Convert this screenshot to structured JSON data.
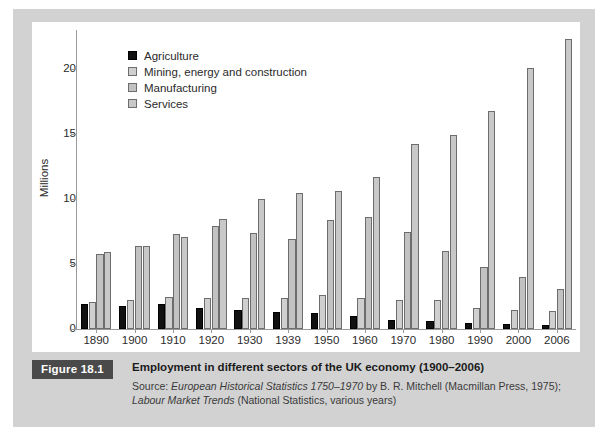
{
  "figure": {
    "badge": "Figure 18.1",
    "title": "Employment in different sectors of the UK economy (1900–2006)",
    "source_line1_prefix": "Source: ",
    "source_line1_italic": "European Historical Statistics 1750–1970",
    "source_line1_suffix": " by B. R. Mitchell (Macmillan Press, 1975);",
    "source_line2_italic": "Labour Market Trends",
    "source_line2_suffix": " (National Statistics, various years)"
  },
  "colors": {
    "agriculture": "#111111",
    "mining": "#cfcfcf",
    "manufacturing": "#c2c2c2",
    "services": "#c8c8c8",
    "frame": "#d2d2d2",
    "panel": "#ffffff",
    "axis": "#9a9a9a",
    "badge_bg": "#4a4a4a"
  },
  "chart_data": {
    "type": "bar",
    "title": "Employment in different sectors of the UK economy (1900–2006)",
    "xlabel": "",
    "ylabel": "Millions",
    "ylim": [
      0,
      23
    ],
    "yticks": [
      0,
      5,
      10,
      15,
      20
    ],
    "ytick_labels": [
      "0",
      "5",
      "10",
      "15",
      "20"
    ],
    "grid": false,
    "legend_position": "top-left-inside",
    "categories": [
      "1890",
      "1900",
      "1910",
      "1920",
      "1930",
      "1939",
      "1950",
      "1960",
      "1970",
      "1980",
      "1990",
      "2000",
      "2006"
    ],
    "series": [
      {
        "name": "Agriculture",
        "color": "#111111",
        "values": [
          1.9,
          1.8,
          1.9,
          1.6,
          1.5,
          1.3,
          1.2,
          1.0,
          0.7,
          0.6,
          0.5,
          0.4,
          0.3
        ]
      },
      {
        "name": "Mining, energy and construction",
        "color": "#cfcfcf",
        "values": [
          2.1,
          2.2,
          2.5,
          2.4,
          2.4,
          2.4,
          2.6,
          2.4,
          2.2,
          2.2,
          1.6,
          1.5,
          1.4
        ]
      },
      {
        "name": "Manufacturing",
        "color": "#c2c2c2",
        "values": [
          5.8,
          6.4,
          7.3,
          7.9,
          7.4,
          6.9,
          8.4,
          8.6,
          7.5,
          6.0,
          4.8,
          4.0,
          3.1
        ]
      },
      {
        "name": "Services",
        "color": "#c8c8c8",
        "values": [
          5.9,
          6.4,
          7.1,
          8.5,
          10.0,
          10.5,
          10.6,
          11.7,
          14.2,
          14.9,
          16.8,
          20.1,
          22.3
        ]
      }
    ]
  },
  "legend": {
    "items": [
      {
        "label": "Agriculture"
      },
      {
        "label": "Mining, energy and construction"
      },
      {
        "label": "Manufacturing"
      },
      {
        "label": "Services"
      }
    ]
  }
}
